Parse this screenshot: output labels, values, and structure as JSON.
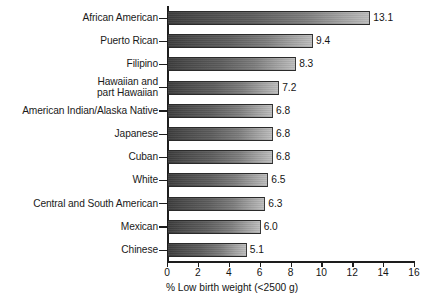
{
  "chart_data": {
    "type": "bar",
    "orientation": "horizontal",
    "title": "",
    "xlabel": "% Low birth weight (<2500 g)",
    "ylabel": "",
    "xlim": [
      0,
      16
    ],
    "xticks": [
      0,
      2,
      4,
      6,
      8,
      10,
      12,
      14,
      16
    ],
    "xtick_labels": [
      "0",
      "2",
      "4",
      "6",
      "8",
      "10",
      "12",
      "14",
      "16"
    ],
    "grid": false,
    "legend": null,
    "categories": [
      "African American",
      "Puerto Rican",
      "Filipino",
      "Hawaiian and\npart Hawaiian",
      "American Indian/Alaska Native",
      "Japanese",
      "Cuban",
      "White",
      "Central and South American",
      "Mexican",
      "Chinese"
    ],
    "values": [
      13.1,
      9.4,
      8.3,
      7.2,
      6.8,
      6.8,
      6.8,
      6.5,
      6.3,
      6.0,
      5.1
    ],
    "value_labels": [
      "13.1",
      "9.4",
      "8.3",
      "7.2",
      "6.8",
      "6.8",
      "6.8",
      "6.5",
      "6.3",
      "6.0",
      "5.1"
    ],
    "bar_color_start": "#3d3d3d",
    "bar_color_end": "#bdbdbd",
    "axis_color": "#1d1d1d",
    "background": "#ffffff"
  }
}
